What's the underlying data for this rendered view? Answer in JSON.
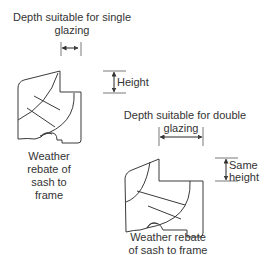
{
  "diagram": {
    "single": {
      "depth_label_line1": "Depth suitable for single",
      "depth_label_line2": "glazing",
      "height_label": "Height",
      "rebate_label_line1": "Weather",
      "rebate_label_line2": "rebate of",
      "rebate_label_line3": "sash to",
      "rebate_label_line4": "frame"
    },
    "double": {
      "depth_label_line1": "Depth suitable for double",
      "depth_label_line2": "glazing",
      "height_label_line1": "Same",
      "height_label_line2": "height",
      "rebate_label_line1": "Weather rebate",
      "rebate_label_line2": "of sash to frame"
    },
    "colors": {
      "line": "#3a3a3a",
      "text": "#333333",
      "background": "#ffffff"
    }
  }
}
